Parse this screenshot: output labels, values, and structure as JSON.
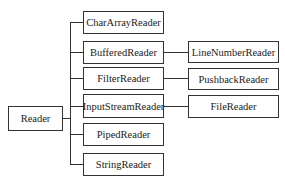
{
  "diagram": {
    "root": {
      "label": "Reader"
    },
    "children": [
      {
        "label": "CharArrayReader"
      },
      {
        "label": "BufferedReader",
        "subclass": "LineNumberReader"
      },
      {
        "label": "FilterReader",
        "subclass": "PushbackReader"
      },
      {
        "label": "InputStreamReader",
        "subclass": "FileReader"
      },
      {
        "label": "PipedReader"
      },
      {
        "label": "StringReader"
      }
    ]
  }
}
